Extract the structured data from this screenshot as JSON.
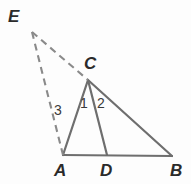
{
  "figure": {
    "background_color": "#fdfdfd",
    "solid_stroke_color": "#6e6e6e",
    "dashed_stroke_color": "#8a8a8a",
    "label_color": "#2b2b2b",
    "angle_label_color": "#3a3a3a",
    "width": 191,
    "height": 184
  },
  "points": {
    "A": {
      "label": "A",
      "x": 63,
      "y": 155,
      "label_x": 54,
      "label_y": 162
    },
    "B": {
      "label": "B",
      "x": 172,
      "y": 156,
      "label_x": 170,
      "label_y": 162
    },
    "C": {
      "label": "C",
      "x": 88,
      "y": 80,
      "label_x": 84,
      "label_y": 55
    },
    "D": {
      "label": "D",
      "x": 107,
      "y": 155,
      "label_x": 100,
      "label_y": 162
    },
    "E": {
      "label": "E",
      "x": 32,
      "y": 32,
      "label_x": 8,
      "label_y": 8
    }
  },
  "segments": [
    {
      "name": "segment-AB",
      "from": "A",
      "to": "B",
      "style": "solid"
    },
    {
      "name": "segment-AC",
      "from": "A",
      "to": "C",
      "style": "solid"
    },
    {
      "name": "segment-CB",
      "from": "C",
      "to": "B",
      "style": "solid"
    },
    {
      "name": "segment-CD",
      "from": "C",
      "to": "D",
      "style": "solid"
    },
    {
      "name": "segment-EC",
      "from": "E",
      "to": "C",
      "style": "dashed"
    },
    {
      "name": "segment-EA",
      "from": "E",
      "to": "A",
      "style": "dashed"
    }
  ],
  "angle_labels": [
    {
      "name": "angle-label-1",
      "text": "1",
      "x": 80,
      "y": 96
    },
    {
      "name": "angle-label-2",
      "text": "2",
      "x": 97,
      "y": 96
    },
    {
      "name": "angle-label-3",
      "text": "3",
      "x": 54,
      "y": 103
    }
  ]
}
